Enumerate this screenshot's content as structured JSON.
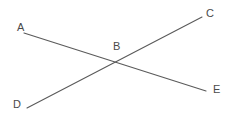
{
  "figure": {
    "type": "geometry-diagram",
    "canvas": {
      "width": 233,
      "height": 122
    },
    "background_color": "#ffffff",
    "stroke_color": "#5a5a5a",
    "label_color": "#4a4a4a",
    "stroke_width": 1.1,
    "segments": [
      {
        "name": "segment-AE",
        "from_label": "A",
        "to_label": "E",
        "x1": 24,
        "y1": 33,
        "x2": 206,
        "y2": 91
      },
      {
        "name": "segment-DC",
        "from_label": "D",
        "to_label": "C",
        "x1": 27,
        "y1": 108,
        "x2": 202,
        "y2": 17
      }
    ],
    "intersection": {
      "label": "B",
      "x": 119,
      "y": 61
    },
    "labels": [
      {
        "id": "A",
        "text": "A",
        "x": 17,
        "y": 22
      },
      {
        "id": "C",
        "text": "C",
        "x": 206,
        "y": 8
      },
      {
        "id": "B",
        "text": "B",
        "x": 113,
        "y": 41
      },
      {
        "id": "D",
        "text": "D",
        "x": 13,
        "y": 99
      },
      {
        "id": "E",
        "text": "E",
        "x": 213,
        "y": 84
      }
    ]
  }
}
